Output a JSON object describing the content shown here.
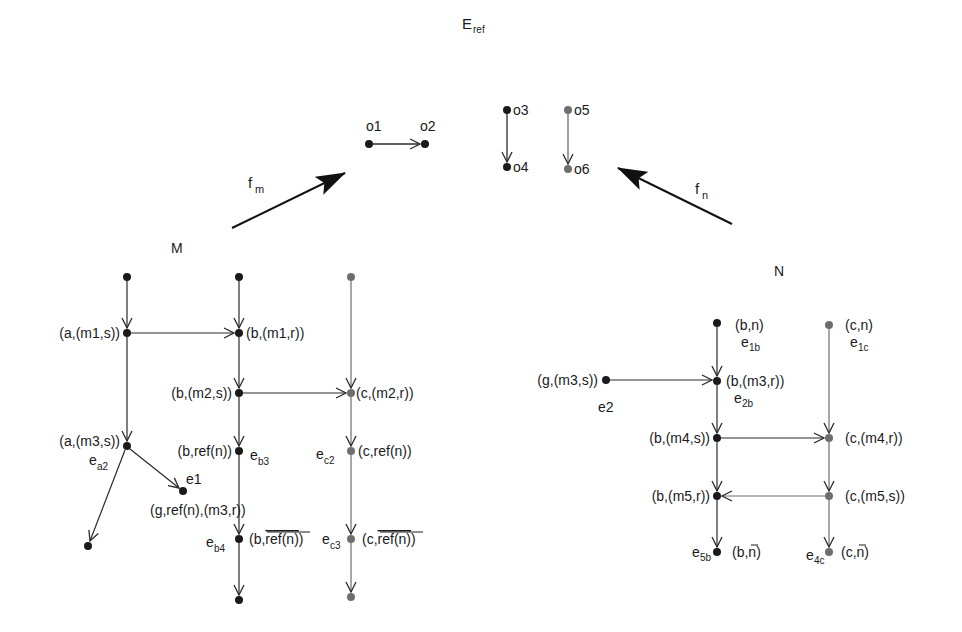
{
  "title": {
    "main": "E",
    "sub": "ref"
  },
  "colors": {
    "dark": "#1a1a1a",
    "gray": "#6e6e6e",
    "line": "#2a2a2a",
    "background": "#ffffff"
  },
  "mappings": {
    "fm": {
      "main": "f",
      "sub": "m"
    },
    "fn": {
      "main": "f",
      "sub": "n"
    }
  },
  "graph_labels": {
    "M": "M",
    "N": "N"
  },
  "eref": {
    "o1": "o1",
    "o2": "o2",
    "o3": "o3",
    "o4": "o4",
    "o5": "o5",
    "o6": "o6"
  },
  "M": {
    "a_m1s": "(a,(m1,s))",
    "b_m1r": "(b,(m1,r))",
    "b_m2s": "(b,(m2,s))",
    "c_m2r": "(c,(m2,r))",
    "a_m3s": "(a,(m3,s))",
    "ea2": {
      "main": "e",
      "sub": "a2"
    },
    "b_refn": "(b,ref(n))",
    "eb3": {
      "main": "e",
      "sub": "b3"
    },
    "ec2": {
      "main": "e",
      "sub": "c2"
    },
    "c_refn": "(c,ref(n))",
    "e1": "e1",
    "g_refn_m3r": "(g,ref(n),(m3,r))",
    "eb4": {
      "main": "e",
      "sub": "b4"
    },
    "b_refn_bar": {
      "prefix": "(b,",
      "overlined": "ref(n)",
      "suffix": ")"
    },
    "ec3": {
      "main": "e",
      "sub": "c3"
    },
    "c_refn_bar": {
      "prefix": "(c,",
      "overlined": "ref(n)",
      "suffix": ")"
    }
  },
  "N": {
    "b_n": "(b,n)",
    "e1b": {
      "main": "e",
      "sub": "1b"
    },
    "c_n": "(c,n)",
    "e1c": {
      "main": "e",
      "sub": "1c"
    },
    "g_m3s": "(g,(m3,s))",
    "e2": "e2",
    "b_m3r": "(b,(m3,r))",
    "e2b": {
      "main": "e",
      "sub": "2b"
    },
    "b_m4s": "(b,(m4,s))",
    "c_m4r": "(c,(m4,r))",
    "b_m5r": "(b,(m5,r))",
    "c_m5s": "(c,(m5,s))",
    "e5b": {
      "main": "e",
      "sub": "5b"
    },
    "b_nbar": {
      "prefix": "(b,",
      "overlined": "n",
      "suffix": ")"
    },
    "e4c": {
      "main": "e",
      "sub": "4c"
    },
    "c_nbar": {
      "prefix": "(c,",
      "overlined": "n",
      "suffix": ")"
    }
  }
}
